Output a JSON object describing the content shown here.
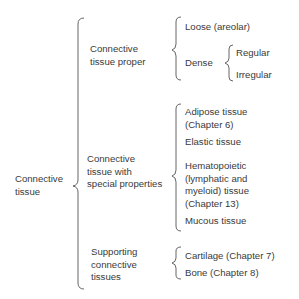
{
  "diagram": {
    "root": {
      "label_line1": "Connective",
      "label_line2": "tissue"
    },
    "categories": [
      {
        "label_line1": "Connective",
        "label_line2": "tissue proper",
        "children": [
          {
            "label": "Loose (areolar)"
          },
          {
            "label": "Dense",
            "children": [
              {
                "label": "Regular"
              },
              {
                "label": "Irregular"
              }
            ]
          }
        ]
      },
      {
        "label_line1": "Connective",
        "label_line2": "tissue with",
        "label_line3": "special properties",
        "children": [
          {
            "label_line1": "Adipose tissue",
            "label_line2": "(Chapter 6)"
          },
          {
            "label": "Elastic tissue"
          },
          {
            "label_line1": "Hematopoietic",
            "label_line2": "(lymphatic and",
            "label_line3": "myeloid) tissue",
            "label_line4": "(Chapter 13)"
          },
          {
            "label": "Mucous tissue"
          }
        ]
      },
      {
        "label_line1": "Supporting",
        "label_line2": "connective",
        "label_line3": "tissues",
        "children": [
          {
            "label": "Cartilage (Chapter 7)"
          },
          {
            "label": "Bone (Chapter 8)"
          }
        ]
      }
    ]
  }
}
